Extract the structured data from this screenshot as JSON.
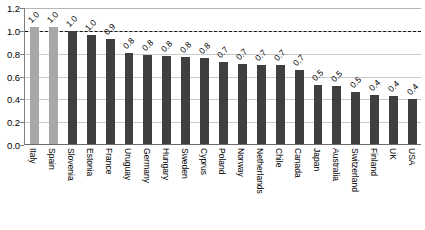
{
  "chart_data": {
    "type": "bar",
    "title": "",
    "subtitle": "",
    "xlabel": "",
    "ylabel": "",
    "ylim": [
      0.0,
      1.2
    ],
    "yticks": [
      "0.0",
      "0.2",
      "0.4",
      "0.6",
      "0.8",
      "1.0",
      "1.2"
    ],
    "ytick_values": [
      0.0,
      0.2,
      0.4,
      0.6,
      0.8,
      1.0,
      1.2
    ],
    "grid": true,
    "legend": "none",
    "reference_line": {
      "value": 1.0,
      "style": "dashed",
      "color": "#141414"
    },
    "colors": {
      "bar": "#3f3f3f",
      "bar_highlight": "#a8a8a8",
      "gridline": "#c9c9c9",
      "axis": "#6b6b6b",
      "text": "#000000"
    },
    "categories": [
      "Italy",
      "Spain",
      "Slovenia",
      "Estonia",
      "France",
      "Uruguay",
      "Germany",
      "Hungary",
      "Sweden",
      "Cyprus",
      "Poland",
      "Norway",
      "Netherlands",
      "Chile",
      "Canada",
      "Japan",
      "Australia",
      "Switzerland",
      "Finland",
      "UK",
      "USA"
    ],
    "values": [
      1.03,
      1.03,
      1.0,
      0.96,
      0.93,
      0.81,
      0.79,
      0.78,
      0.77,
      0.76,
      0.73,
      0.71,
      0.7,
      0.7,
      0.66,
      0.53,
      0.52,
      0.46,
      0.44,
      0.43,
      0.4
    ],
    "labels": [
      "1.0",
      "1.0",
      "1.0",
      "1.0",
      "0.9",
      "0.8",
      "0.8",
      "0.8",
      "0.8",
      "0.8",
      "0.7",
      "0.7",
      "0.7",
      "0.7",
      "0.7",
      "0.5",
      "0.5",
      "0.5",
      "0.4",
      "0.4",
      "0.4"
    ],
    "highlighted": [
      true,
      true,
      false,
      false,
      false,
      false,
      false,
      false,
      false,
      false,
      false,
      false,
      false,
      false,
      false,
      false,
      false,
      false,
      false,
      false,
      false
    ]
  }
}
